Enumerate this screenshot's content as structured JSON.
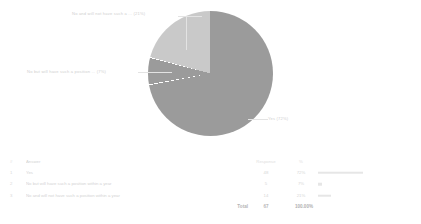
{
  "chart_data": {
    "type": "pie",
    "title": "",
    "categories": [
      "Yes",
      "No but will have such a position within a year",
      "No and will not have such a position within a year"
    ],
    "values": [
      48,
      5,
      14
    ],
    "percentages": [
      72,
      7,
      21
    ],
    "labels": [
      "Yes (72%)",
      "No but will have such a position ... (7%)",
      "No and will not have such a ... (21%)"
    ],
    "colors": [
      "#9b9b9b",
      "#9b9b9b",
      "#c9c9c9"
    ],
    "legend": "none",
    "total": 67
  },
  "pie": {
    "label_top": "No and will not have such a ... (21%)",
    "label_left": "No but will have such a position ... (7%)",
    "label_right": "Yes (72%)"
  },
  "table": {
    "headers": {
      "num": "#",
      "answer": "Answer",
      "response": "Response",
      "percent": "%",
      "bar": "",
      "end": ""
    },
    "rows": [
      {
        "num": "1",
        "answer": "Yes",
        "response": "48",
        "percent": "72%",
        "bar_pct": 72,
        "end": ""
      },
      {
        "num": "2",
        "answer": "No but will have such a position within a year",
        "response": "5",
        "percent": "7%",
        "bar_pct": 7,
        "end": ""
      },
      {
        "num": "3",
        "answer": "No and will not have such a position within a year",
        "response": "14",
        "percent": "21%",
        "bar_pct": 21,
        "end": ""
      }
    ],
    "total": {
      "label": "Total",
      "response": "67",
      "percent": "100.00%"
    }
  }
}
